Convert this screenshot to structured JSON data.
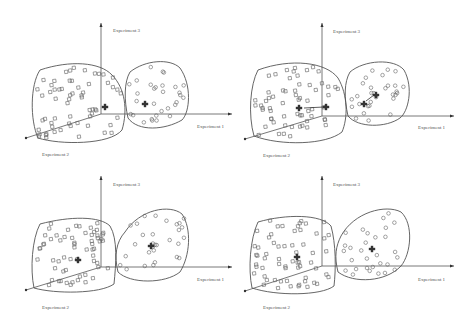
{
  "figure": {
    "axis_labels": {
      "x": "Experiment 1",
      "y": "Experiment 3",
      "z": "Experiment 2"
    },
    "colors": {
      "line": "#555555",
      "marker": "#666666",
      "centroid": "#333333",
      "background": "#ffffff"
    },
    "marker_types": {
      "cluster_a": "square",
      "cluster_b": "circle",
      "centroid": "cross"
    },
    "panels": [
      {
        "id": "top-left",
        "state": "initial centroids",
        "centroids": [
          [
            105,
            107
          ],
          [
            145,
            104
          ]
        ],
        "moves": []
      },
      {
        "id": "top-right",
        "state": "centroids moving",
        "centroids": [
          [
            63,
            108
          ],
          [
            90,
            107
          ],
          [
            128,
            104
          ],
          [
            140,
            95
          ]
        ],
        "moves": [
          [
            [
              88,
              107
            ],
            [
              68,
              108
            ]
          ],
          [
            [
              138,
              95
            ],
            [
              130,
              101
            ]
          ]
        ]
      },
      {
        "id": "bottom-left",
        "state": "converged",
        "centroids": [
          [
            78,
            96
          ],
          [
            151,
            82
          ]
        ],
        "moves": []
      },
      {
        "id": "bottom-right",
        "state": "final clusters",
        "centroids": [
          [
            61,
            93
          ],
          [
            136,
            85
          ]
        ],
        "moves": []
      }
    ]
  }
}
